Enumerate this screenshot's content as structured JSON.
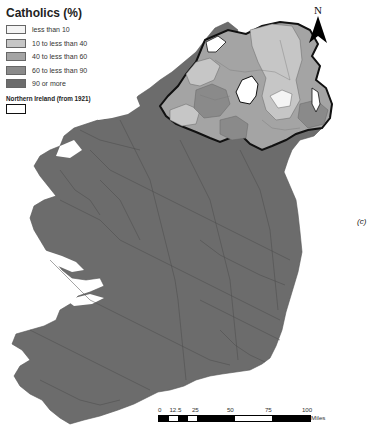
{
  "legend": {
    "title": "Catholics (%)",
    "categories": [
      {
        "label": "less than 10",
        "color": "#f4f4f4"
      },
      {
        "label": "10 to less than 40",
        "color": "#c6c6c6"
      },
      {
        "label": "40 to less than 60",
        "color": "#a4a4a4"
      },
      {
        "label": "60 to less than 90",
        "color": "#8a8a8a"
      },
      {
        "label": "90 or more",
        "color": "#6c6c6c"
      }
    ],
    "boundary_title": "Northern Ireland (from 1921)"
  },
  "north_arrow": {
    "label": "N"
  },
  "panel_label": "(c)",
  "scale_bar": {
    "ticks": [
      "0",
      "12.5",
      "25",
      "50",
      "75",
      "100"
    ],
    "unit": "Miles"
  },
  "colors": {
    "land_majority": "#6c6c6c",
    "boundary": "#111111",
    "district_lines": "#444444",
    "lough": "#ffffff"
  }
}
